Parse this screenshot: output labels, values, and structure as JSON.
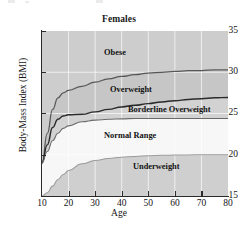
{
  "figure": {
    "title": "Females",
    "xlabel": "Age",
    "ylabel": "Body-Mass Index (BMI)"
  },
  "chart_data": {
    "type": "area",
    "title": "Females",
    "subtitle": "",
    "xlabel": "Age",
    "ylabel": "Body-Mass Index (BMI)",
    "xlim": [
      10,
      80
    ],
    "ylim": [
      15,
      35
    ],
    "xticks": [
      10,
      20,
      30,
      40,
      50,
      60,
      70,
      80
    ],
    "yticks": [
      15,
      20,
      25,
      30,
      35
    ],
    "grid": true,
    "legend_position": "inline-annotations",
    "x": [
      10,
      12,
      14,
      16,
      18,
      20,
      25,
      30,
      35,
      40,
      45,
      50,
      55,
      60,
      65,
      70,
      75,
      80
    ],
    "series": [
      {
        "name": "Obese threshold",
        "values": [
          19.0,
          22.6,
          25.5,
          26.9,
          27.5,
          27.8,
          28.3,
          28.8,
          29.2,
          29.5,
          29.7,
          29.9,
          30.0,
          30.1,
          30.2,
          30.2,
          30.3,
          30.3
        ]
      },
      {
        "name": "Overweight threshold",
        "values": [
          19.0,
          21.2,
          23.3,
          24.3,
          24.7,
          24.85,
          24.9,
          25.2,
          25.5,
          25.8,
          26.0,
          26.2,
          26.4,
          26.55,
          26.7,
          26.8,
          26.9,
          26.95
        ]
      },
      {
        "name": "Borderline Overweight threshold",
        "values": [
          19.0,
          20.4,
          21.7,
          22.6,
          23.2,
          23.5,
          24.0,
          24.2,
          24.3,
          24.35,
          24.4,
          24.4,
          24.4,
          24.4,
          24.4,
          24.4,
          24.4,
          24.4
        ]
      },
      {
        "name": "Underweight threshold",
        "values": [
          15.0,
          15.4,
          16.2,
          17.0,
          17.6,
          18.1,
          18.9,
          19.3,
          19.55,
          19.7,
          19.8,
          19.88,
          19.93,
          19.96,
          19.98,
          20.0,
          20.0,
          20.0
        ]
      }
    ],
    "bands": [
      {
        "name": "Obese",
        "label": "Obese",
        "fill": "#cdcdcd"
      },
      {
        "name": "Overweight",
        "label": "Overweight",
        "fill": "#c6c6c6"
      },
      {
        "name": "Borderline Overweight",
        "label": "Borderline Overweight",
        "fill": "#d2d2d2"
      },
      {
        "name": "Normal Range",
        "label": "Normal Range",
        "fill": "#f7f7f7"
      },
      {
        "name": "Underweight",
        "label": "Underweight",
        "fill": "#cfcfcf"
      }
    ]
  },
  "annotations": {
    "obese": "Obese",
    "overweight": "Overweight",
    "borderline_overweight": "Borderline Overweight",
    "normal_range": "Normal Range",
    "underweight": "Underweight"
  },
  "axes": {
    "y_tick_labels": [
      "35",
      "30",
      "25",
      "20",
      "15"
    ],
    "x_tick_labels": [
      "10",
      "20",
      "30",
      "40",
      "50",
      "60",
      "70",
      "80"
    ]
  }
}
